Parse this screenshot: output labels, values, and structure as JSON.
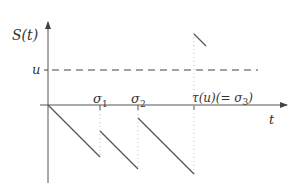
{
  "diagram": {
    "y_axis_label": "S(t)",
    "x_axis_label": "t",
    "threshold_label": "u",
    "tick_labels": {
      "sigma1": "σ",
      "sigma1_sub": "1",
      "sigma2": "σ",
      "sigma2_sub": "2",
      "tau": "τ(u)(= σ",
      "tau_sub": "3",
      "tau_close": ")"
    },
    "colors": {
      "line": "#555555",
      "dotted": "#bbbbbb",
      "dashed": "#444444"
    }
  }
}
